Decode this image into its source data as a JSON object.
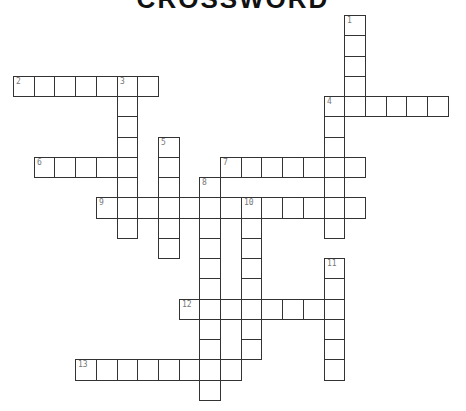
{
  "puzzle": {
    "title": "CROSSWORD",
    "grid": {
      "origin_x": 13,
      "origin_y": 15,
      "cell_w": 20.7,
      "cell_h": 20.25
    },
    "words": [
      {
        "number": 1,
        "direction": "down",
        "col": 16,
        "row": 0,
        "length": 5
      },
      {
        "number": 2,
        "direction": "across",
        "col": 0,
        "row": 3,
        "length": 7
      },
      {
        "number": 3,
        "direction": "down",
        "col": 5,
        "row": 3,
        "length": 8
      },
      {
        "number": 4,
        "direction": "across",
        "col": 15,
        "row": 4,
        "length": 6
      },
      {
        "number": 4,
        "direction": "down",
        "col": 15,
        "row": 4,
        "length": 7
      },
      {
        "number": 5,
        "direction": "down",
        "col": 7,
        "row": 6,
        "length": 6
      },
      {
        "number": 6,
        "direction": "across",
        "col": 1,
        "row": 7,
        "length": 5
      },
      {
        "number": 7,
        "direction": "across",
        "col": 10,
        "row": 7,
        "length": 7
      },
      {
        "number": 8,
        "direction": "down",
        "col": 9,
        "row": 8,
        "length": 11
      },
      {
        "number": 9,
        "direction": "across",
        "col": 4,
        "row": 9,
        "length": 13
      },
      {
        "number": 10,
        "direction": "down",
        "col": 11,
        "row": 9,
        "length": 8
      },
      {
        "number": 11,
        "direction": "down",
        "col": 15,
        "row": 12,
        "length": 6
      },
      {
        "number": 12,
        "direction": "across",
        "col": 8,
        "row": 14,
        "length": 8
      },
      {
        "number": 13,
        "direction": "across",
        "col": 3,
        "row": 17,
        "length": 8
      }
    ]
  }
}
